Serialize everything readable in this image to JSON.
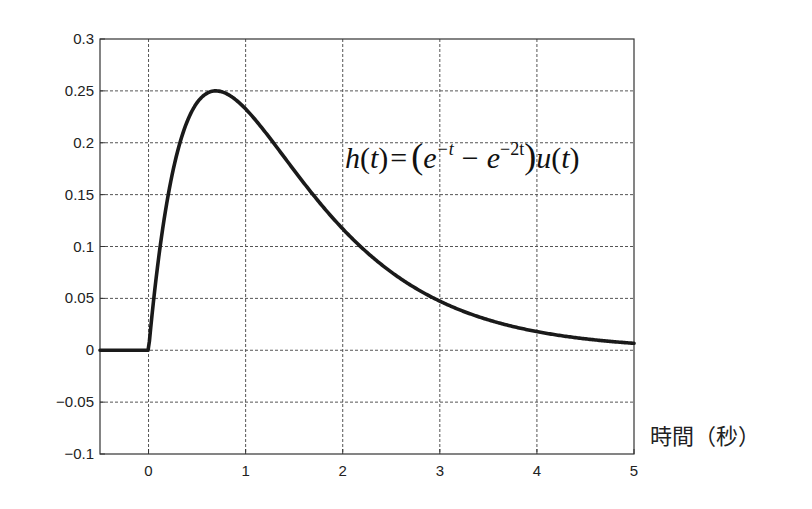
{
  "chart_data": {
    "type": "line",
    "title": "",
    "annotation": "h(t) = (e^{-t} - e^{-2t}) u(t)",
    "formula_parts": {
      "h": "h",
      "t1": "t",
      "eq": "=",
      "lparen": "(",
      "e1": "e",
      "e1_exp": "−t",
      "minus": "−",
      "e2": "e",
      "e2_exp": "−2t",
      "rparen": ")",
      "u": "u",
      "t2": "t"
    },
    "xlabel": "時間（秒）",
    "ylabel": "",
    "xlim": [
      -0.5,
      5
    ],
    "ylim": [
      -0.1,
      0.3
    ],
    "xticks": [
      0,
      1,
      2,
      3,
      4,
      5
    ],
    "xtick_labels": [
      "0",
      "1",
      "2",
      "3",
      "4",
      "5"
    ],
    "yticks": [
      -0.1,
      -0.05,
      0,
      0.05,
      0.1,
      0.15,
      0.2,
      0.25,
      0.3
    ],
    "ytick_labels": [
      "−0.1",
      "−0.05",
      "0",
      "0.05",
      "0.1",
      "0.15",
      "0.2",
      "0.25",
      "0.3"
    ],
    "grid": true,
    "legend": null,
    "series": [
      {
        "name": "h(t)",
        "x": [
          -0.5,
          0,
          0.1,
          0.2,
          0.3,
          0.4,
          0.5,
          0.6,
          0.693,
          0.8,
          1.0,
          1.25,
          1.5,
          1.75,
          2.0,
          2.5,
          3.0,
          3.5,
          4.0,
          4.5,
          5.0
        ],
        "y": [
          0,
          0,
          0.0861,
          0.1484,
          0.192,
          0.221,
          0.2387,
          0.2476,
          0.25,
          0.2474,
          0.2325,
          0.2044,
          0.1733,
          0.1436,
          0.117,
          0.0753,
          0.0473,
          0.0293,
          0.018,
          0.011,
          0.0067
        ]
      }
    ]
  }
}
